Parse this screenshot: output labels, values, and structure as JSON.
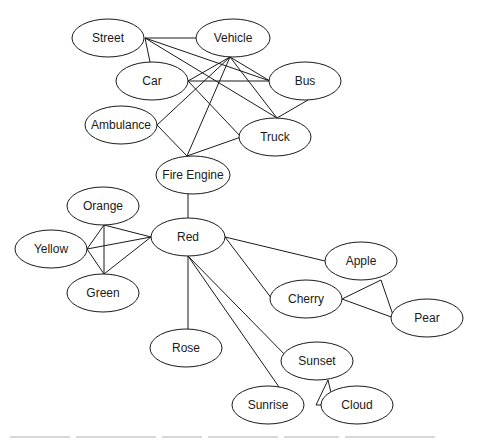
{
  "diagram": {
    "type": "semantic-network",
    "style": {
      "stroke": "#1a1a1a",
      "fill": "#ffffff",
      "background": "#ffffff"
    },
    "nodes": [
      {
        "id": "street",
        "label": "Street",
        "cx": 108,
        "cy": 38,
        "rx": 36,
        "ry": 19
      },
      {
        "id": "vehicle",
        "label": "Vehicle",
        "cx": 233,
        "cy": 38,
        "rx": 37,
        "ry": 19
      },
      {
        "id": "car",
        "label": "Car",
        "cx": 152,
        "cy": 81,
        "rx": 36,
        "ry": 19
      },
      {
        "id": "bus",
        "label": "Bus",
        "cx": 305,
        "cy": 81,
        "rx": 36,
        "ry": 19
      },
      {
        "id": "ambulance",
        "label": "Ambulance",
        "cx": 121,
        "cy": 125,
        "rx": 36,
        "ry": 19
      },
      {
        "id": "truck",
        "label": "Truck",
        "cx": 275,
        "cy": 137,
        "rx": 36,
        "ry": 19
      },
      {
        "id": "fire-engine",
        "label": "Fire Engine",
        "cx": 193,
        "cy": 175,
        "rx": 37,
        "ry": 19
      },
      {
        "id": "orange",
        "label": "Orange",
        "cx": 103,
        "cy": 206,
        "rx": 36,
        "ry": 19
      },
      {
        "id": "red",
        "label": "Red",
        "cx": 188,
        "cy": 237,
        "rx": 37,
        "ry": 19
      },
      {
        "id": "yellow",
        "label": "Yellow",
        "cx": 51,
        "cy": 249,
        "rx": 36,
        "ry": 19
      },
      {
        "id": "green",
        "label": "Green",
        "cx": 103,
        "cy": 293,
        "rx": 36,
        "ry": 19
      },
      {
        "id": "apple",
        "label": "Apple",
        "cx": 361,
        "cy": 261,
        "rx": 36,
        "ry": 19
      },
      {
        "id": "cherry",
        "label": "Cherry",
        "cx": 306,
        "cy": 299,
        "rx": 36,
        "ry": 19
      },
      {
        "id": "pear",
        "label": "Pear",
        "cx": 427,
        "cy": 318,
        "rx": 36,
        "ry": 19
      },
      {
        "id": "rose",
        "label": "Rose",
        "cx": 186,
        "cy": 348,
        "rx": 36,
        "ry": 19
      },
      {
        "id": "sunset",
        "label": "Sunset",
        "cx": 317,
        "cy": 361,
        "rx": 36,
        "ry": 19
      },
      {
        "id": "sunrise",
        "label": "Sunrise",
        "cx": 268,
        "cy": 405,
        "rx": 36,
        "ry": 19
      },
      {
        "id": "cloud",
        "label": "Cloud",
        "cx": 357,
        "cy": 405,
        "rx": 36,
        "ry": 19
      }
    ],
    "edges": [
      {
        "from": "street",
        "to": "vehicle",
        "x1": 145,
        "y1": 38,
        "x2": 196,
        "y2": 38
      },
      {
        "from": "street",
        "to": "car",
        "x1": 145,
        "y1": 38,
        "x2": 150,
        "y2": 62
      },
      {
        "from": "street",
        "to": "bus",
        "x1": 145,
        "y1": 38,
        "x2": 270,
        "y2": 81
      },
      {
        "from": "street",
        "to": "truck",
        "x1": 145,
        "y1": 38,
        "x2": 277,
        "y2": 118
      },
      {
        "from": "vehicle",
        "to": "car",
        "x1": 230,
        "y1": 57,
        "x2": 188,
        "y2": 81
      },
      {
        "from": "vehicle",
        "to": "bus",
        "x1": 230,
        "y1": 57,
        "x2": 270,
        "y2": 81
      },
      {
        "from": "vehicle",
        "to": "truck",
        "x1": 230,
        "y1": 57,
        "x2": 277,
        "y2": 118
      },
      {
        "from": "vehicle",
        "to": "ambulance",
        "x1": 230,
        "y1": 57,
        "x2": 157,
        "y2": 125
      },
      {
        "from": "vehicle",
        "to": "fire-engine",
        "x1": 230,
        "y1": 57,
        "x2": 187,
        "y2": 156
      },
      {
        "from": "car",
        "to": "bus",
        "x1": 188,
        "y1": 81,
        "x2": 270,
        "y2": 81
      },
      {
        "from": "car",
        "to": "truck",
        "x1": 188,
        "y1": 81,
        "x2": 241,
        "y2": 137
      },
      {
        "from": "bus",
        "to": "truck",
        "x1": 308,
        "y1": 100,
        "x2": 277,
        "y2": 118
      },
      {
        "from": "ambulance",
        "to": "fire-engine",
        "x1": 157,
        "y1": 125,
        "x2": 187,
        "y2": 156
      },
      {
        "from": "truck",
        "to": "fire-engine",
        "x1": 241,
        "y1": 137,
        "x2": 187,
        "y2": 156
      },
      {
        "from": "fire-engine",
        "to": "red",
        "x1": 188,
        "y1": 194,
        "x2": 188,
        "y2": 218
      },
      {
        "from": "orange",
        "to": "red",
        "x1": 104,
        "y1": 225,
        "x2": 151,
        "y2": 237
      },
      {
        "from": "orange",
        "to": "yellow",
        "x1": 104,
        "y1": 225,
        "x2": 87,
        "y2": 249
      },
      {
        "from": "orange",
        "to": "green",
        "x1": 104,
        "y1": 225,
        "x2": 104,
        "y2": 274
      },
      {
        "from": "yellow",
        "to": "red",
        "x1": 87,
        "y1": 249,
        "x2": 151,
        "y2": 237
      },
      {
        "from": "yellow",
        "to": "green",
        "x1": 87,
        "y1": 249,
        "x2": 104,
        "y2": 274
      },
      {
        "from": "green",
        "to": "red",
        "x1": 104,
        "y1": 274,
        "x2": 151,
        "y2": 237
      },
      {
        "from": "red",
        "to": "apple",
        "x1": 225,
        "y1": 237,
        "x2": 325,
        "y2": 261
      },
      {
        "from": "red",
        "to": "cherry",
        "x1": 225,
        "y1": 237,
        "x2": 272,
        "y2": 299
      },
      {
        "from": "red",
        "to": "rose",
        "x1": 188,
        "y1": 256,
        "x2": 188,
        "y2": 329
      },
      {
        "from": "red",
        "to": "sunset",
        "x1": 188,
        "y1": 256,
        "x2": 291,
        "y2": 361
      },
      {
        "from": "red",
        "to": "sunrise",
        "x1": 188,
        "y1": 256,
        "x2": 279,
        "y2": 387
      },
      {
        "from": "cherry",
        "to": "apple",
        "x1": 342,
        "y1": 299,
        "x2": 381,
        "y2": 280
      },
      {
        "from": "cherry",
        "to": "pear",
        "x1": 342,
        "y1": 299,
        "x2": 394,
        "y2": 318
      },
      {
        "from": "apple",
        "to": "pear",
        "x1": 381,
        "y1": 280,
        "x2": 394,
        "y2": 318
      },
      {
        "from": "sunset",
        "to": "sunrise",
        "x1": 328,
        "y1": 380,
        "x2": 316,
        "y2": 405
      },
      {
        "from": "sunset",
        "to": "cloud",
        "x1": 328,
        "y1": 380,
        "x2": 334,
        "y2": 405
      },
      {
        "from": "sunrise",
        "to": "cloud",
        "x1": 316,
        "y1": 405,
        "x2": 334,
        "y2": 405
      }
    ]
  }
}
